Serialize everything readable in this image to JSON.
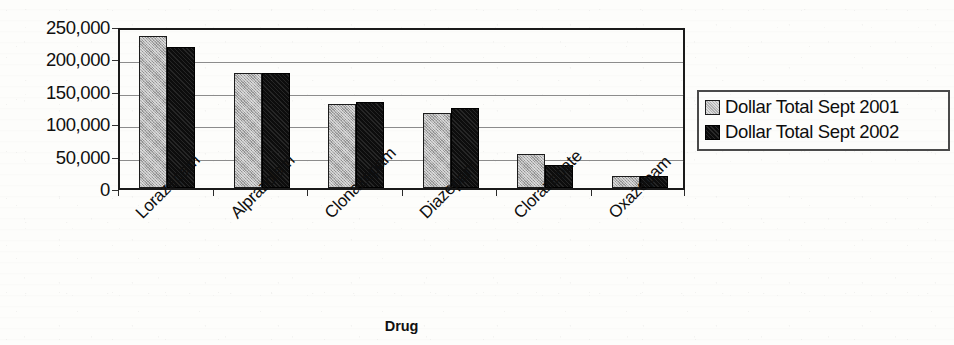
{
  "chart_data": {
    "type": "bar",
    "title": "",
    "xlabel": "Drug",
    "ylabel": "Dollar Total (Thousands)",
    "categories": [
      "Lorazepam",
      "Alprazolam",
      "Clonazepam",
      "Diazepam",
      "Clorazepate",
      "Oxazepam"
    ],
    "series": [
      {
        "name": "Dollar Total Sept 2001",
        "color": "#b0b0b0",
        "values": [
          234000,
          177000,
          129000,
          115000,
          52000,
          19000
        ]
      },
      {
        "name": "Dollar Total Sept 2002",
        "color": "#0d0d0d",
        "values": [
          218000,
          177000,
          132000,
          124000,
          35000,
          19000
        ]
      }
    ],
    "ylim": [
      0,
      250000
    ],
    "ytick_values": [
      250000,
      200000,
      150000,
      100000,
      50000,
      0
    ],
    "ytick_labels": [
      "250,000",
      "200,000",
      "150,000",
      "100,000",
      "50,000",
      "0"
    ],
    "grid": true,
    "grid_axis": "y",
    "legend_position": "right"
  },
  "legend": {
    "entries": [
      {
        "label": "Dollar Total Sept 2001",
        "swatch": "gray-swatch"
      },
      {
        "label": "Dollar Total Sept 2002",
        "swatch": "black-swatch"
      }
    ]
  },
  "axes": {
    "y_title": "Dollar Total (Thousands)",
    "x_title": "Drug"
  }
}
